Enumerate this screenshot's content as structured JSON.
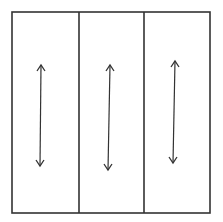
{
  "diagram": {
    "stroke_color": "#333333",
    "background": "#ffffff",
    "frame": {
      "x": 12,
      "y": 12,
      "width": 198,
      "height": 201
    },
    "dividers": [
      79,
      144
    ],
    "panels": [
      {
        "name": "panel-1",
        "arrow": {
          "x1": 41,
          "y1": 65,
          "x2": 40,
          "y2": 166,
          "direction": "bidirectional-vertical"
        }
      },
      {
        "name": "panel-2",
        "arrow": {
          "x1": 110,
          "y1": 65,
          "x2": 108,
          "y2": 170,
          "direction": "bidirectional-vertical"
        }
      },
      {
        "name": "panel-3",
        "arrow": {
          "x1": 175,
          "y1": 61,
          "x2": 173,
          "y2": 163,
          "direction": "bidirectional-vertical"
        }
      }
    ]
  }
}
